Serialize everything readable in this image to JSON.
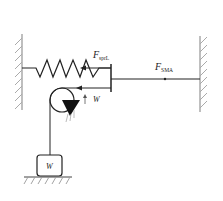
{
  "diagram": {
    "title": "",
    "labels": {
      "spring_force": {
        "main": "F",
        "sub": "sprL"
      },
      "sma_force": {
        "main": "F",
        "sub": "SMA"
      },
      "pulley_weight": "W",
      "block_weight": "W"
    },
    "components": [
      "left-wall",
      "right-wall",
      "spring",
      "plate",
      "sma-wire",
      "pulley",
      "pulley-support",
      "cable",
      "weight-block",
      "ground"
    ],
    "colors": {
      "line": "#222222",
      "hatch": "#999999",
      "background": "#ffffff"
    }
  }
}
